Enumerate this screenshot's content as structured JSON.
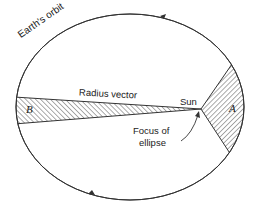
{
  "diagram": {
    "type": "kepler-second-law",
    "labels": {
      "orbit": "Earth's orbit",
      "radius_vector": "Radius vector",
      "sun": "Sun",
      "focus_line1": "Focus of",
      "focus_line2": "ellipse",
      "sector_a": "A",
      "sector_b": "B"
    },
    "colors": {
      "line": "#333333",
      "hatch": "#444444",
      "background": "#ffffff"
    }
  }
}
